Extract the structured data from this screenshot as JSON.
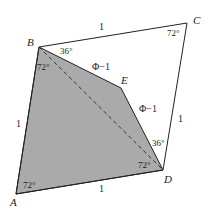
{
  "figure": {
    "colors": {
      "background": "#ffffff",
      "shaded_fill": "#aaaaaa",
      "stroke": "#222222"
    },
    "vertices": {
      "A": {
        "label": "A",
        "x": 16,
        "y": 194
      },
      "B": {
        "label": "B",
        "x": 39,
        "y": 47
      },
      "C": {
        "label": "C",
        "x": 187,
        "y": 23
      },
      "D": {
        "label": "D",
        "x": 163,
        "y": 170
      },
      "E": {
        "label": "E",
        "x": 121,
        "y": 88
      }
    },
    "edges": {
      "BC": "1",
      "CD": "1",
      "AB": "1",
      "AD": "1",
      "BE": "Φ−1",
      "ED": "Φ−1"
    },
    "angles": {
      "C": "72°",
      "B_upper": "36°",
      "B_lower": "72°",
      "D_upper": "36°",
      "D_lower": "72°",
      "A": "72°"
    },
    "diagonal": "BD (dashed)"
  }
}
